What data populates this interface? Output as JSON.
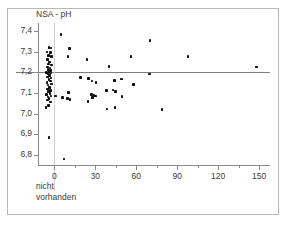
{
  "figure": {
    "ytitle": "NSA - pH",
    "group_caption_line1": "nicht",
    "group_caption_line2": "vorhanden",
    "frame_color": "#b9b9b9",
    "axis_color": "#8a8a8a",
    "point_color": "#111111",
    "reference_line_color": "#7d7d7d"
  },
  "chart_data": {
    "type": "scatter",
    "title": "",
    "xlabel": "",
    "ylabel": "NSA - pH",
    "xlim": [
      -12,
      158
    ],
    "ylim": [
      6.75,
      7.44
    ],
    "grid": false,
    "legend": null,
    "x_ticks": [
      0,
      30,
      60,
      90,
      120,
      150
    ],
    "x_tick_labels": [
      "0",
      "30",
      "60",
      "90",
      "120",
      "150"
    ],
    "x_minor_ticks": [
      15,
      45,
      75,
      105,
      135
    ],
    "y_ticks": [
      6.8,
      6.9,
      7.0,
      7.1,
      7.2,
      7.3,
      7.4
    ],
    "y_tick_labels": [
      "6,8",
      "6,9",
      "7,0",
      "7,1",
      "7,2",
      "7,3",
      "7,4"
    ],
    "reference_line_y": 7.2,
    "separator_x": 0,
    "annotations": [
      {
        "text": "nicht vorhanden",
        "x": 0,
        "note": "group label below x=0 separator"
      }
    ],
    "series": [
      {
        "name": "nicht vorhanden",
        "note": "dense cluster left of x = 0",
        "points": [
          [
            -4.0,
            7.32
          ],
          [
            -2.5,
            7.318
          ],
          [
            -5.5,
            7.3
          ],
          [
            -3.0,
            7.298
          ],
          [
            -4.5,
            7.283
          ],
          [
            -2.0,
            7.276
          ],
          [
            -5.0,
            7.262
          ],
          [
            -3.5,
            7.25
          ],
          [
            -4.2,
            7.24
          ],
          [
            -2.2,
            7.236
          ],
          [
            -5.2,
            7.226
          ],
          [
            -3.2,
            7.222
          ],
          [
            -4.8,
            7.214
          ],
          [
            -2.8,
            7.21
          ],
          [
            -3.8,
            7.204
          ],
          [
            -5.6,
            7.2
          ],
          [
            -2.4,
            7.198
          ],
          [
            -4.4,
            7.192
          ],
          [
            -3.4,
            7.186
          ],
          [
            -5.0,
            7.178
          ],
          [
            -2.6,
            7.172
          ],
          [
            -4.0,
            7.166
          ],
          [
            -3.0,
            7.158
          ],
          [
            -5.4,
            7.15
          ],
          [
            -2.2,
            7.144
          ],
          [
            -4.6,
            7.138
          ],
          [
            -3.6,
            7.128
          ],
          [
            -5.0,
            7.12
          ],
          [
            -2.8,
            7.112
          ],
          [
            -4.2,
            7.106
          ],
          [
            -3.2,
            7.098
          ],
          [
            -5.6,
            7.092
          ],
          [
            -2.4,
            7.086
          ],
          [
            -4.8,
            7.08
          ],
          [
            -3.8,
            7.074
          ],
          [
            -5.2,
            7.066
          ],
          [
            -3.0,
            7.056
          ],
          [
            -4.4,
            7.04
          ],
          [
            -6.0,
            7.028
          ],
          [
            -4.0,
            6.885
          ]
        ]
      },
      {
        "name": "vorhanden",
        "note": "points at x > 0",
        "points": [
          [
            5.0,
            7.385
          ],
          [
            11.0,
            7.315
          ],
          [
            10.0,
            7.276
          ],
          [
            24.0,
            7.262
          ],
          [
            40.0,
            7.228
          ],
          [
            56.0,
            7.276
          ],
          [
            70.0,
            7.356
          ],
          [
            98.0,
            7.278
          ],
          [
            148.0,
            7.226
          ],
          [
            69.5,
            7.192
          ],
          [
            19.0,
            7.176
          ],
          [
            25.0,
            7.17
          ],
          [
            27.5,
            7.158
          ],
          [
            30.5,
            7.152
          ],
          [
            44.0,
            7.16
          ],
          [
            49.0,
            7.168
          ],
          [
            58.0,
            7.14
          ],
          [
            1.0,
            7.086
          ],
          [
            6.0,
            7.078
          ],
          [
            9.5,
            7.072
          ],
          [
            10.5,
            7.102
          ],
          [
            11.5,
            7.068
          ],
          [
            27.0,
            7.094
          ],
          [
            29.0,
            7.088
          ],
          [
            30.0,
            7.086
          ],
          [
            28.0,
            7.078
          ],
          [
            24.5,
            7.058
          ],
          [
            38.0,
            7.112
          ],
          [
            43.0,
            7.114
          ],
          [
            45.0,
            7.106
          ],
          [
            49.5,
            7.084
          ],
          [
            38.5,
            7.022
          ],
          [
            44.5,
            7.028
          ],
          [
            79.0,
            7.02
          ],
          [
            7.0,
            6.78
          ]
        ]
      }
    ]
  }
}
